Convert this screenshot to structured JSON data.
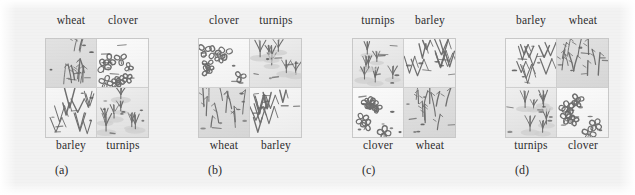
{
  "figure": {
    "background_color": "#f2f2f2",
    "ink_color": "#6f6f6f",
    "label_color": "#2e2e2e"
  },
  "chart_data": {
    "type": "diagram",
    "title": "",
    "subtitle": "",
    "xlabel": "",
    "ylabel": "",
    "legend_position": "none",
    "grid": false,
    "treatments": [
      "wheat",
      "clover",
      "barley",
      "turnips"
    ],
    "panels": [
      {
        "caption": "(a)",
        "top_labels": [
          "wheat",
          "clover"
        ],
        "bottom_labels": [
          "barley",
          "turnips"
        ],
        "cells": [
          {
            "position": "top-left",
            "crop": "wheat"
          },
          {
            "position": "top-right",
            "crop": "clover"
          },
          {
            "position": "bottom-left",
            "crop": "barley"
          },
          {
            "position": "bottom-right",
            "crop": "turnips"
          }
        ]
      },
      {
        "caption": "(b)",
        "top_labels": [
          "clover",
          "turnips"
        ],
        "bottom_labels": [
          "wheat",
          "barley"
        ],
        "cells": [
          {
            "position": "top-left",
            "crop": "clover"
          },
          {
            "position": "top-right",
            "crop": "turnips"
          },
          {
            "position": "bottom-left",
            "crop": "wheat"
          },
          {
            "position": "bottom-right",
            "crop": "barley"
          }
        ]
      },
      {
        "caption": "(c)",
        "top_labels": [
          "turnips",
          "barley"
        ],
        "bottom_labels": [
          "clover",
          "wheat"
        ],
        "cells": [
          {
            "position": "top-left",
            "crop": "turnips"
          },
          {
            "position": "top-right",
            "crop": "barley"
          },
          {
            "position": "bottom-left",
            "crop": "clover"
          },
          {
            "position": "bottom-right",
            "crop": "wheat"
          }
        ]
      },
      {
        "caption": "(d)",
        "top_labels": [
          "barley",
          "wheat"
        ],
        "bottom_labels": [
          "turnips",
          "clover"
        ],
        "cells": [
          {
            "position": "top-left",
            "crop": "barley"
          },
          {
            "position": "top-right",
            "crop": "wheat"
          },
          {
            "position": "bottom-left",
            "crop": "turnips"
          },
          {
            "position": "bottom-right",
            "crop": "clover"
          }
        ]
      }
    ]
  }
}
